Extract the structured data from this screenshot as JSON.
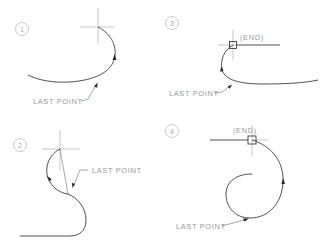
{
  "figure": {
    "panels": [
      {
        "number": "1",
        "label": "LAST POINT",
        "end_label": ""
      },
      {
        "number": "2",
        "label": "LAST POINT",
        "end_label": ""
      },
      {
        "number": "3",
        "label": "LAST POINT",
        "end_label": "(END)"
      },
      {
        "number": "4",
        "label": "LAST POINT",
        "end_label": "(END)"
      }
    ],
    "colors": {
      "curve": "#3c3c3c",
      "crosshair": "#b8b8b8",
      "text": "#9a9a9a",
      "background": "#ffffff"
    }
  }
}
